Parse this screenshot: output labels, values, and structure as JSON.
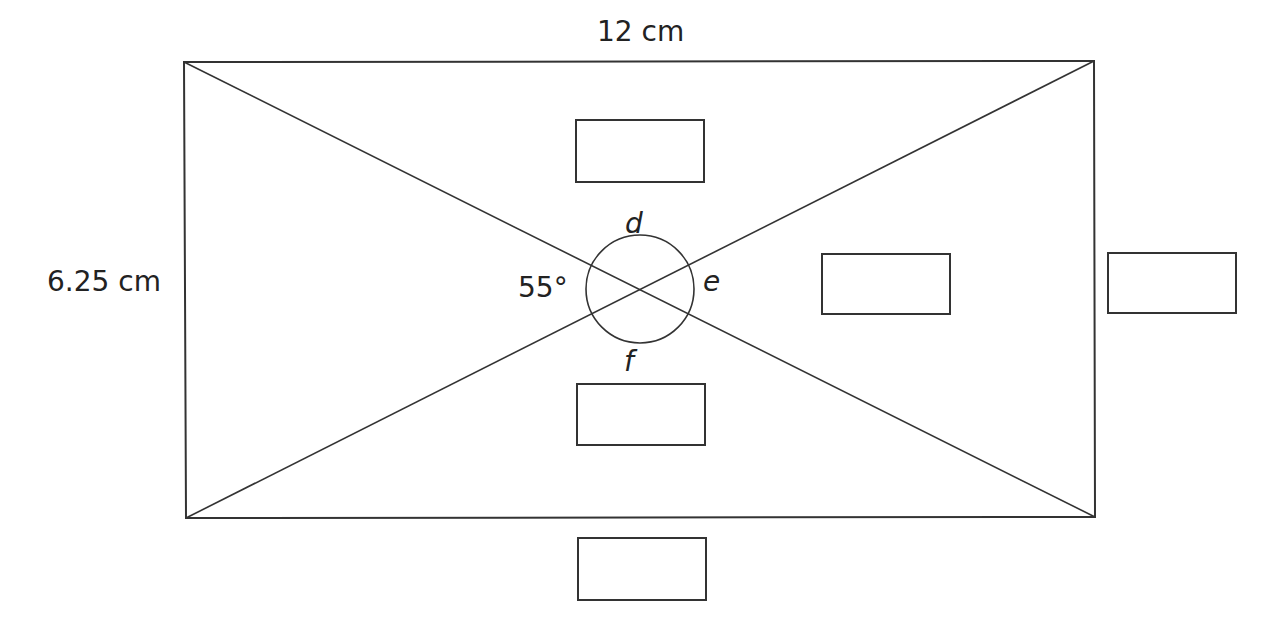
{
  "diagram": {
    "width_label": "12 cm",
    "height_label": "6.25 cm",
    "angles": {
      "known": "55°",
      "d": "d",
      "e": "e",
      "f": "f"
    },
    "answer_boxes": [
      {
        "id": "box-top",
        "value": ""
      },
      {
        "id": "box-right-inner",
        "value": ""
      },
      {
        "id": "box-right-outer",
        "value": ""
      },
      {
        "id": "box-bottom-inner",
        "value": ""
      },
      {
        "id": "box-bottom-outer",
        "value": ""
      }
    ],
    "colors": {
      "stroke": "#333333",
      "background": "#ffffff"
    }
  }
}
